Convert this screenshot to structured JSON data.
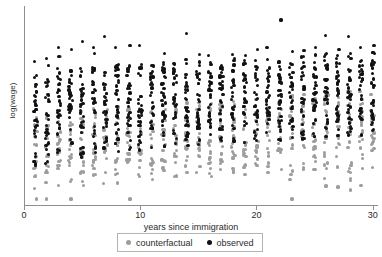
{
  "chart_data": {
    "type": "scatter",
    "title": "",
    "xlabel": "years since immigration",
    "ylabel": "log(wage)",
    "xlim": [
      0,
      30.8
    ],
    "ylim": [
      0,
      1
    ],
    "xticks": [
      0,
      10,
      20,
      30
    ],
    "xtick_labels": [
      "0",
      "10",
      "20",
      "30"
    ],
    "yticks": [],
    "ytick_labels": [],
    "grid": false,
    "legend_position": "below-axes",
    "legend": [
      {
        "name": "counterfactual",
        "color": "#9d9d9d",
        "marker": "circle"
      },
      {
        "name": "observed",
        "color": "#121212",
        "marker": "circle"
      }
    ],
    "series": [
      {
        "name": "observed",
        "color": "#121212",
        "description": "Black points: observed log wages, vertical strips at each integer year since immigration, rising slightly with years.",
        "strips": [
          {
            "x": 1,
            "low": 0.175,
            "high": 0.66,
            "dense_low": 0.3,
            "dense_high": 0.62,
            "n": 34,
            "outliers": [
              0.72
            ]
          },
          {
            "x": 2,
            "low": 0.21,
            "high": 0.64,
            "dense_low": 0.33,
            "dense_high": 0.6,
            "n": 30,
            "outliers": [
              0.7,
              0.735
            ]
          },
          {
            "x": 3,
            "low": 0.25,
            "high": 0.7,
            "dense_low": 0.34,
            "dense_high": 0.64,
            "n": 31,
            "outliers": [
              0.79,
              0.745
            ]
          },
          {
            "x": 4,
            "low": 0.23,
            "high": 0.69,
            "dense_low": 0.33,
            "dense_high": 0.64,
            "n": 29,
            "outliers": [
              0.78
            ]
          },
          {
            "x": 5,
            "low": 0.24,
            "high": 0.7,
            "dense_low": 0.35,
            "dense_high": 0.65,
            "n": 33,
            "outliers": [
              0.82
            ]
          },
          {
            "x": 6,
            "low": 0.255,
            "high": 0.705,
            "dense_low": 0.35,
            "dense_high": 0.655,
            "n": 32,
            "outliers": [
              0.79,
              0.76
            ]
          },
          {
            "x": 7,
            "low": 0.26,
            "high": 0.7,
            "dense_low": 0.36,
            "dense_high": 0.65,
            "n": 30,
            "outliers": [
              0.845
            ]
          },
          {
            "x": 8,
            "low": 0.265,
            "high": 0.715,
            "dense_low": 0.36,
            "dense_high": 0.66,
            "n": 31,
            "outliers": [
              0.79
            ]
          },
          {
            "x": 9,
            "low": 0.27,
            "high": 0.71,
            "dense_low": 0.365,
            "dense_high": 0.655,
            "n": 30,
            "outliers": [
              0.8
            ]
          },
          {
            "x": 10,
            "low": 0.275,
            "high": 0.715,
            "dense_low": 0.37,
            "dense_high": 0.66,
            "n": 32,
            "outliers": [
              0.8
            ]
          },
          {
            "x": 11,
            "low": 0.28,
            "high": 0.705,
            "dense_low": 0.37,
            "dense_high": 0.655,
            "n": 28,
            "outliers": []
          },
          {
            "x": 12,
            "low": 0.285,
            "high": 0.73,
            "dense_low": 0.375,
            "dense_high": 0.665,
            "n": 31,
            "outliers": [
              0.76
            ]
          },
          {
            "x": 13,
            "low": 0.29,
            "high": 0.72,
            "dense_low": 0.38,
            "dense_high": 0.66,
            "n": 29,
            "outliers": []
          },
          {
            "x": 14,
            "low": 0.295,
            "high": 0.735,
            "dense_low": 0.385,
            "dense_high": 0.67,
            "n": 33,
            "outliers": [
              0.86
            ]
          },
          {
            "x": 15,
            "low": 0.3,
            "high": 0.73,
            "dense_low": 0.385,
            "dense_high": 0.665,
            "n": 30,
            "outliers": [
              0.755
            ]
          },
          {
            "x": 16,
            "low": 0.3,
            "high": 0.725,
            "dense_low": 0.39,
            "dense_high": 0.665,
            "n": 29,
            "outliers": [
              0.75
            ]
          },
          {
            "x": 17,
            "low": 0.305,
            "high": 0.73,
            "dense_low": 0.39,
            "dense_high": 0.67,
            "n": 30,
            "outliers": []
          },
          {
            "x": 18,
            "low": 0.31,
            "high": 0.735,
            "dense_low": 0.395,
            "dense_high": 0.67,
            "n": 31,
            "outliers": [
              0.755
            ]
          },
          {
            "x": 19,
            "low": 0.31,
            "high": 0.725,
            "dense_low": 0.395,
            "dense_high": 0.665,
            "n": 28,
            "outliers": [
              0.75
            ]
          },
          {
            "x": 20,
            "low": 0.315,
            "high": 0.74,
            "dense_low": 0.4,
            "dense_high": 0.675,
            "n": 30,
            "outliers": [
              0.78
            ]
          },
          {
            "x": 21,
            "low": 0.32,
            "high": 0.735,
            "dense_low": 0.4,
            "dense_high": 0.67,
            "n": 29,
            "outliers": [
              0.79
            ]
          },
          {
            "x": 22,
            "low": 0.32,
            "high": 0.745,
            "dense_low": 0.405,
            "dense_high": 0.68,
            "n": 32,
            "outliers": [
              0.93
            ]
          },
          {
            "x": 23,
            "low": 0.325,
            "high": 0.745,
            "dense_low": 0.405,
            "dense_high": 0.68,
            "n": 30,
            "outliers": [
              0.77
            ]
          },
          {
            "x": 24,
            "low": 0.33,
            "high": 0.75,
            "dense_low": 0.41,
            "dense_high": 0.685,
            "n": 31,
            "outliers": [
              0.775
            ]
          },
          {
            "x": 25,
            "low": 0.335,
            "high": 0.76,
            "dense_low": 0.415,
            "dense_high": 0.695,
            "n": 33,
            "outliers": [
              0.79
            ]
          },
          {
            "x": 26,
            "low": 0.34,
            "high": 0.765,
            "dense_low": 0.42,
            "dense_high": 0.7,
            "n": 32,
            "outliers": [
              0.85
            ]
          },
          {
            "x": 27,
            "low": 0.345,
            "high": 0.76,
            "dense_low": 0.42,
            "dense_high": 0.695,
            "n": 30,
            "outliers": [
              0.78
            ]
          },
          {
            "x": 28,
            "low": 0.345,
            "high": 0.77,
            "dense_low": 0.425,
            "dense_high": 0.7,
            "n": 31,
            "outliers": [
              0.845
            ]
          },
          {
            "x": 29,
            "low": 0.35,
            "high": 0.765,
            "dense_low": 0.425,
            "dense_high": 0.7,
            "n": 30,
            "outliers": [
              0.79
            ]
          },
          {
            "x": 30,
            "low": 0.355,
            "high": 0.77,
            "dense_low": 0.43,
            "dense_high": 0.705,
            "n": 32,
            "outliers": [
              0.8
            ]
          }
        ]
      },
      {
        "name": "counterfactual",
        "color": "#9d9d9d",
        "description": "Gray points: counterfactual log wages, shifted downward relative to observed, with a long low tail.",
        "strips": [
          {
            "x": 1,
            "low": 0.055,
            "high": 0.44,
            "dense_low": 0.15,
            "dense_high": 0.4,
            "n": 22,
            "outliers": [
              0.03
            ]
          },
          {
            "x": 2,
            "low": 0.065,
            "high": 0.455,
            "dense_low": 0.16,
            "dense_high": 0.41,
            "n": 21,
            "outliers": [
              0.03,
              0.7
            ]
          },
          {
            "x": 3,
            "low": 0.08,
            "high": 0.47,
            "dense_low": 0.175,
            "dense_high": 0.425,
            "n": 22,
            "outliers": [
              0.745
            ]
          },
          {
            "x": 4,
            "low": 0.06,
            "high": 0.47,
            "dense_low": 0.175,
            "dense_high": 0.425,
            "n": 21,
            "outliers": [
              0.03
            ]
          },
          {
            "x": 5,
            "low": 0.095,
            "high": 0.48,
            "dense_low": 0.185,
            "dense_high": 0.435,
            "n": 22,
            "outliers": []
          },
          {
            "x": 6,
            "low": 0.1,
            "high": 0.485,
            "dense_low": 0.19,
            "dense_high": 0.44,
            "n": 21,
            "outliers": []
          },
          {
            "x": 7,
            "low": 0.105,
            "high": 0.49,
            "dense_low": 0.195,
            "dense_high": 0.445,
            "n": 22,
            "outliers": []
          },
          {
            "x": 8,
            "low": 0.11,
            "high": 0.495,
            "dense_low": 0.195,
            "dense_high": 0.45,
            "n": 21,
            "outliers": []
          },
          {
            "x": 9,
            "low": 0.06,
            "high": 0.5,
            "dense_low": 0.2,
            "dense_high": 0.455,
            "n": 22,
            "outliers": [
              0.03
            ]
          },
          {
            "x": 10,
            "low": 0.115,
            "high": 0.505,
            "dense_low": 0.205,
            "dense_high": 0.455,
            "n": 21,
            "outliers": []
          },
          {
            "x": 11,
            "low": 0.12,
            "high": 0.5,
            "dense_low": 0.205,
            "dense_high": 0.455,
            "n": 20,
            "outliers": []
          },
          {
            "x": 12,
            "low": 0.125,
            "high": 0.51,
            "dense_low": 0.21,
            "dense_high": 0.46,
            "n": 22,
            "outliers": []
          },
          {
            "x": 13,
            "low": 0.13,
            "high": 0.51,
            "dense_low": 0.215,
            "dense_high": 0.465,
            "n": 21,
            "outliers": []
          },
          {
            "x": 14,
            "low": 0.135,
            "high": 0.52,
            "dense_low": 0.22,
            "dense_high": 0.47,
            "n": 22,
            "outliers": []
          },
          {
            "x": 15,
            "low": 0.14,
            "high": 0.52,
            "dense_low": 0.22,
            "dense_high": 0.47,
            "n": 21,
            "outliers": []
          },
          {
            "x": 16,
            "low": 0.14,
            "high": 0.525,
            "dense_low": 0.225,
            "dense_high": 0.475,
            "n": 21,
            "outliers": []
          },
          {
            "x": 17,
            "low": 0.145,
            "high": 0.525,
            "dense_low": 0.225,
            "dense_high": 0.475,
            "n": 20,
            "outliers": []
          },
          {
            "x": 18,
            "low": 0.15,
            "high": 0.53,
            "dense_low": 0.23,
            "dense_high": 0.48,
            "n": 22,
            "outliers": []
          },
          {
            "x": 19,
            "low": 0.15,
            "high": 0.53,
            "dense_low": 0.23,
            "dense_high": 0.48,
            "n": 21,
            "outliers": []
          },
          {
            "x": 20,
            "low": 0.155,
            "high": 0.54,
            "dense_low": 0.235,
            "dense_high": 0.485,
            "n": 22,
            "outliers": []
          },
          {
            "x": 21,
            "low": 0.16,
            "high": 0.54,
            "dense_low": 0.235,
            "dense_high": 0.485,
            "n": 21,
            "outliers": []
          },
          {
            "x": 22,
            "low": 0.16,
            "high": 0.55,
            "dense_low": 0.24,
            "dense_high": 0.495,
            "n": 22,
            "outliers": []
          },
          {
            "x": 23,
            "low": 0.05,
            "high": 0.55,
            "dense_low": 0.24,
            "dense_high": 0.495,
            "n": 21,
            "outliers": [
              0.03
            ]
          },
          {
            "x": 24,
            "low": 0.165,
            "high": 0.555,
            "dense_low": 0.245,
            "dense_high": 0.5,
            "n": 22,
            "outliers": []
          },
          {
            "x": 25,
            "low": 0.17,
            "high": 0.565,
            "dense_low": 0.25,
            "dense_high": 0.505,
            "n": 23,
            "outliers": []
          },
          {
            "x": 26,
            "low": 0.12,
            "high": 0.57,
            "dense_low": 0.255,
            "dense_high": 0.51,
            "n": 22,
            "outliers": [
              0.095
            ]
          },
          {
            "x": 27,
            "low": 0.13,
            "high": 0.565,
            "dense_low": 0.255,
            "dense_high": 0.505,
            "n": 21,
            "outliers": [
              0.09
            ]
          },
          {
            "x": 28,
            "low": 0.115,
            "high": 0.575,
            "dense_low": 0.26,
            "dense_high": 0.51,
            "n": 22,
            "outliers": [
              0.075
            ]
          },
          {
            "x": 29,
            "low": 0.135,
            "high": 0.57,
            "dense_low": 0.26,
            "dense_high": 0.51,
            "n": 21,
            "outliers": [
              0.1
            ]
          },
          {
            "x": 30,
            "low": 0.175,
            "high": 0.58,
            "dense_low": 0.265,
            "dense_high": 0.515,
            "n": 22,
            "outliers": []
          }
        ]
      }
    ]
  }
}
